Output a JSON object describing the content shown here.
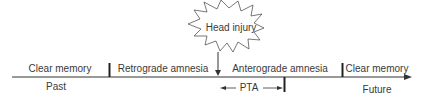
{
  "diagram": {
    "event": {
      "label": "Head injury",
      "icon": "starburst"
    },
    "segments": [
      {
        "label": "Clear memory",
        "position": "above"
      },
      {
        "label": "Retrograde amnesia",
        "position": "above"
      },
      {
        "label": "Anterograde amnesia",
        "position": "above"
      },
      {
        "label": "Clear memory",
        "position": "above"
      }
    ],
    "axis": {
      "start_label": "Past",
      "end_label": "Future"
    },
    "interval": {
      "label": "PTA"
    },
    "colors": {
      "line": "#333333",
      "text": "#3a3a3a",
      "background": "#ffffff"
    }
  }
}
